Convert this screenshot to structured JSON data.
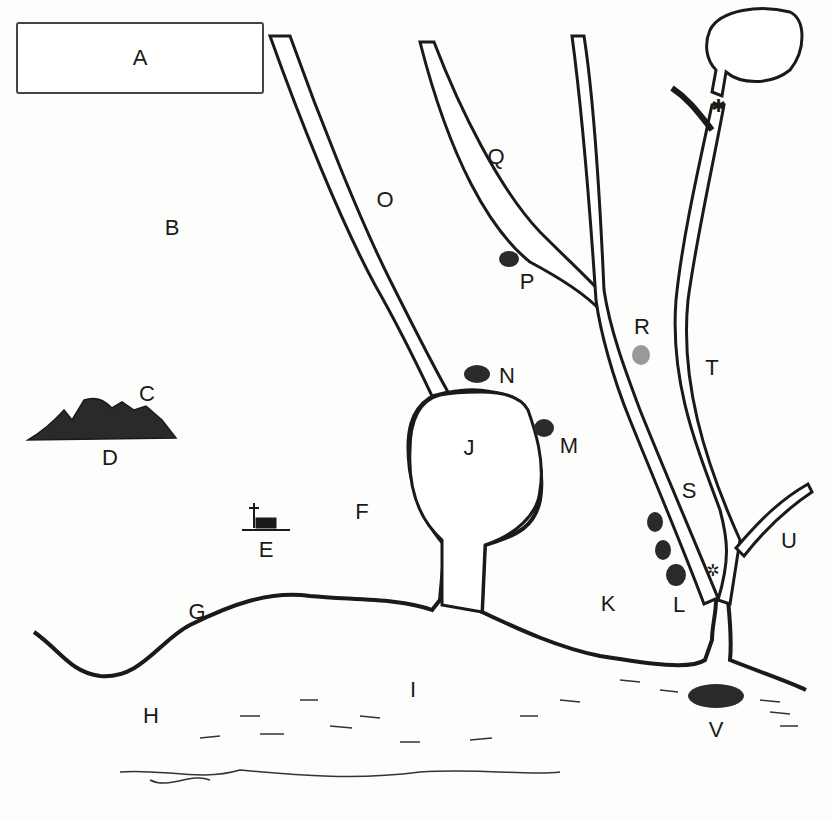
{
  "map": {
    "title_box": {
      "label": "A"
    },
    "labels": [
      {
        "id": "B",
        "text": "B",
        "x": 172,
        "y": 228,
        "feature": "open-land"
      },
      {
        "id": "C",
        "text": "C",
        "x": 147,
        "y": 394,
        "feature": "mountains"
      },
      {
        "id": "D",
        "text": "D",
        "x": 110,
        "y": 458,
        "feature": "mountains-base"
      },
      {
        "id": "E",
        "text": "E",
        "x": 266,
        "y": 550,
        "feature": "church-settlement"
      },
      {
        "id": "F",
        "text": "F",
        "x": 362,
        "y": 512,
        "feature": "land"
      },
      {
        "id": "G",
        "text": "G",
        "x": 197,
        "y": 612,
        "feature": "coastline"
      },
      {
        "id": "H",
        "text": "H",
        "x": 151,
        "y": 716,
        "feature": "sea"
      },
      {
        "id": "I",
        "text": "I",
        "x": 413,
        "y": 690,
        "feature": "sea"
      },
      {
        "id": "J",
        "text": "J",
        "x": 469,
        "y": 448,
        "feature": "lake"
      },
      {
        "id": "K",
        "text": "K",
        "x": 608,
        "y": 604,
        "feature": "land"
      },
      {
        "id": "L",
        "text": "L",
        "x": 679,
        "y": 605,
        "feature": "rocks"
      },
      {
        "id": "M",
        "text": "M",
        "x": 569,
        "y": 446,
        "feature": "rock"
      },
      {
        "id": "N",
        "text": "N",
        "x": 507,
        "y": 376,
        "feature": "rock"
      },
      {
        "id": "O",
        "text": "O",
        "x": 385,
        "y": 200,
        "feature": "river"
      },
      {
        "id": "P",
        "text": "P",
        "x": 527,
        "y": 282,
        "feature": "rock"
      },
      {
        "id": "Q",
        "text": "Q",
        "x": 496,
        "y": 157,
        "feature": "river"
      },
      {
        "id": "R",
        "text": "R",
        "x": 642,
        "y": 327,
        "feature": "rock"
      },
      {
        "id": "S",
        "text": "S",
        "x": 689,
        "y": 491,
        "feature": "river"
      },
      {
        "id": "T",
        "text": "T",
        "x": 712,
        "y": 368,
        "feature": "river"
      },
      {
        "id": "U",
        "text": "U",
        "x": 789,
        "y": 541,
        "feature": "river"
      },
      {
        "id": "V",
        "text": "V",
        "x": 716,
        "y": 730,
        "feature": "island"
      }
    ],
    "colors": {
      "ink": "#1a1a1a",
      "paper": "#fdfdfc",
      "water": "#ffffff"
    }
  }
}
